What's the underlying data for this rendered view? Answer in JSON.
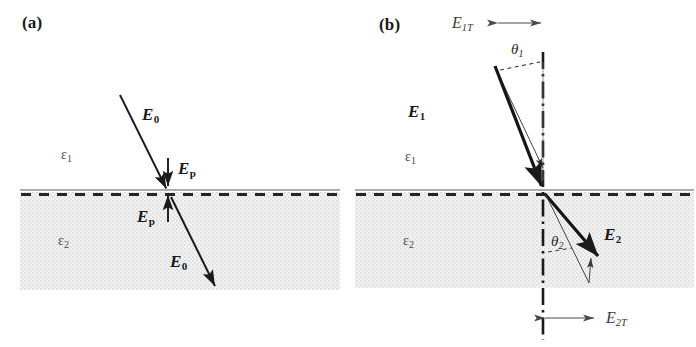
{
  "figure": {
    "background_color": "#ffffff",
    "ink_color": "#1a1a1a",
    "medium2_fill": "#ededed",
    "dot_color": "#b9b9b9"
  },
  "panels": [
    {
      "id": "a",
      "tag": "(a)",
      "description": "Normal-incidence polarization: incident field E0 crosses the interface, depolarization field Ep shown on both sides.",
      "labels": {
        "medium1": {
          "symbol": "ε",
          "sub": "1"
        },
        "medium2": {
          "symbol": "ε",
          "sub": "2"
        },
        "incident_field": {
          "symbol": "E",
          "sub": "0"
        },
        "transmitted_field": {
          "symbol": "E",
          "sub": "0"
        },
        "polarization_field_above": {
          "symbol": "E",
          "sub": "p"
        },
        "polarization_field_below": {
          "symbol": "E",
          "sub": "p"
        }
      }
    },
    {
      "id": "b",
      "tag": "(b)",
      "description": "Oblique incidence: field E1 in medium 1 at angle theta-1 to the normal refracts to E2 at theta-2, tangential components E1T and E2T marked.",
      "labels": {
        "medium1": {
          "symbol": "ε",
          "sub": "1"
        },
        "medium2": {
          "symbol": "ε",
          "sub": "2"
        },
        "field_1": {
          "symbol": "E",
          "sub": "1"
        },
        "field_2": {
          "symbol": "E",
          "sub": "2"
        },
        "tangential_1": {
          "symbol": "E",
          "sub": "1T"
        },
        "tangential_2": {
          "symbol": "E",
          "sub": "2T"
        },
        "angle_1": {
          "symbol": "θ",
          "sub": "1"
        },
        "angle_2": {
          "symbol": "θ",
          "sub": "2"
        }
      }
    }
  ],
  "geometry": {
    "panel_a": {
      "interface_y": 190,
      "slab_left": 20,
      "slab_right": 340,
      "slab_bottom": 290,
      "incidence_point": [
        168,
        191
      ],
      "incident_arrow": {
        "x1": 120,
        "y1": 95,
        "x2": 166,
        "y2": 189
      },
      "transmitted_arrow": {
        "x1": 171,
        "y1": 196,
        "x2": 216,
        "y2": 288
      },
      "ep_arrow_above": {
        "x1": 168,
        "y1": 160,
        "x2": 168,
        "y2": 188
      },
      "ep_arrow_below": {
        "x1": 168,
        "y1": 220,
        "x2": 168,
        "y2": 193
      }
    },
    "panel_b": {
      "interface_y": 190,
      "slab_left": 355,
      "slab_right": 694,
      "slab_bottom": 288,
      "incidence_point": [
        543,
        191
      ],
      "normal_line_x": 543,
      "normal_top": 55,
      "normal_bottom": 340,
      "e1_arrow": {
        "x1": 495,
        "y1": 68,
        "x2": 541,
        "y2": 189
      },
      "e1_vertical_component": {
        "x1": 495,
        "y1": 68,
        "x2": 543,
        "y2": 170
      },
      "e2_arrow": {
        "x1": 545,
        "y1": 193,
        "x2": 600,
        "y2": 260
      },
      "e2_lower_point": [
        590,
        285
      ],
      "e1t_arrow": {
        "x1": 496,
        "y1": 23,
        "x2": 543,
        "y2": 23
      },
      "e2t_arrow": {
        "x1": 543,
        "y1": 318,
        "x2": 596,
        "y2": 318
      }
    }
  }
}
